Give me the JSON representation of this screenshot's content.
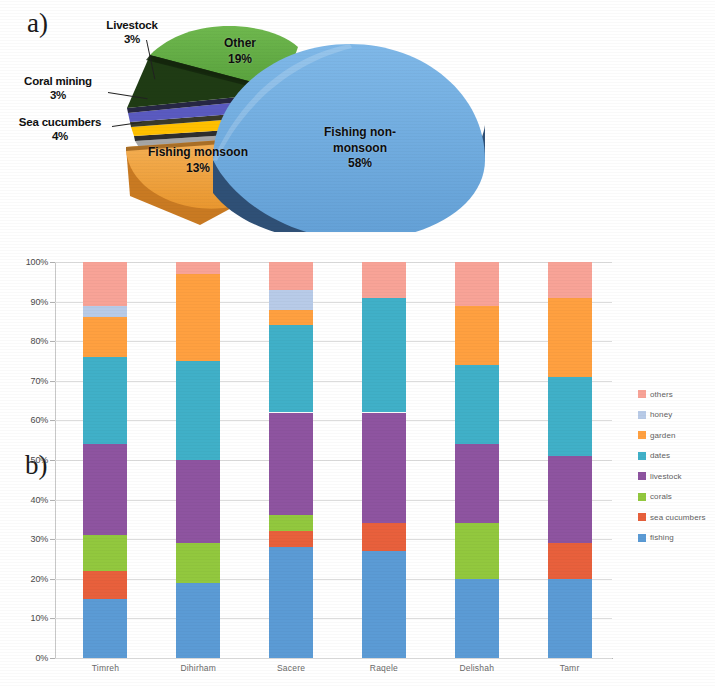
{
  "figure": {
    "panel_a_letter": "a)",
    "panel_b_letter": "b)"
  },
  "chart_data": [
    {
      "type": "pie",
      "title": "",
      "panel": "a)",
      "labels": [
        "Fishing non-monsoon",
        "Other",
        "Fishing monsoon",
        "Sea cucumbers",
        "Coral mining",
        "Livestock"
      ],
      "values": [
        58,
        19,
        13,
        4,
        3,
        3
      ],
      "value_labels": [
        "58%",
        "19%",
        "13%",
        "4%",
        "3%",
        "3%"
      ],
      "colors": [
        "#6aa9e0",
        "#61a845",
        "#f0a340",
        "#a6a6a6",
        "#ffc000",
        "#5a5ac0"
      ],
      "exploded": [
        "Fishing non-monsoon"
      ],
      "three_d": true,
      "legend": "none",
      "slices": [
        {
          "label": "Fishing non-monsoon",
          "label_text": "Fishing non-\nmonsoon",
          "value": 58,
          "value_label": "58%",
          "color": "#6aa9e0",
          "label_position": "inside"
        },
        {
          "label": "Other",
          "label_text": "Other",
          "value": 19,
          "value_label": "19%",
          "color": "#61a845",
          "label_position": "inside"
        },
        {
          "label": "Fishing monsoon",
          "label_text": "Fishing monsoon",
          "value": 13,
          "value_label": "13%",
          "color": "#f0a340",
          "label_position": "inside"
        },
        {
          "label": "Sea cucumbers",
          "label_text": "Sea cucumbers",
          "value": 4,
          "value_label": "4%",
          "color": "#a6a6a6",
          "label_position": "callout-left"
        },
        {
          "label": "Coral mining",
          "label_text": "Coral mining",
          "value": 3,
          "value_label": "3%",
          "color": "#ffc000",
          "label_position": "callout-left"
        },
        {
          "label": "Livestock",
          "label_text": "Livestock",
          "value": 3,
          "value_label": "3%",
          "color": "#5a5ac0",
          "label_position": "callout-top"
        }
      ]
    },
    {
      "type": "bar",
      "subtype": "stacked-100-percent",
      "panel": "b)",
      "title": "",
      "xlabel": "",
      "ylabel": "",
      "ylim": [
        0,
        100
      ],
      "ytick_labels": [
        "0%",
        "10%",
        "20%",
        "30%",
        "40%",
        "50%",
        "60%",
        "70%",
        "80%",
        "90%",
        "100%"
      ],
      "ytick_values": [
        0,
        10,
        20,
        30,
        40,
        50,
        60,
        70,
        80,
        90,
        100
      ],
      "grid": true,
      "legend_position": "right",
      "categories": [
        "Timreh",
        "Dihirham",
        "Sacere",
        "Raqele",
        "Delishah",
        "Tamr"
      ],
      "series": [
        {
          "name": "fishing",
          "color": "#5b9bd5",
          "values": [
            15,
            19,
            28,
            27,
            20,
            20
          ]
        },
        {
          "name": "sea cucumbers",
          "color": "#e8603c",
          "values": [
            7,
            0,
            4,
            7,
            0,
            9
          ]
        },
        {
          "name": "corals",
          "color": "#92c83e",
          "values": [
            9,
            10,
            4,
            0,
            14,
            0
          ]
        },
        {
          "name": "livestock",
          "color": "#8e54a0",
          "values": [
            23,
            21,
            26,
            28,
            20,
            22
          ]
        },
        {
          "name": "dates",
          "color": "#40b0c8",
          "values": [
            22,
            25,
            22,
            29,
            20,
            20
          ]
        },
        {
          "name": "garden",
          "color": "#ffa040",
          "values": [
            10,
            22,
            4,
            0,
            15,
            20
          ]
        },
        {
          "name": "honey",
          "color": "#b8cbe8",
          "values": [
            3,
            0,
            5,
            0,
            0,
            0
          ]
        },
        {
          "name": "others",
          "color": "#f8a397",
          "values": [
            11,
            3,
            7,
            9,
            11,
            9
          ]
        }
      ],
      "legend_entries": [
        {
          "label": "others",
          "color": "#f8a397"
        },
        {
          "label": "honey",
          "color": "#b8cbe8"
        },
        {
          "label": "garden",
          "color": "#ffa040"
        },
        {
          "label": "dates",
          "color": "#40b0c8"
        },
        {
          "label": "livestock",
          "color": "#8e54a0"
        },
        {
          "label": "corals",
          "color": "#92c83e"
        },
        {
          "label": "sea cucumbers",
          "color": "#e8603c"
        },
        {
          "label": "fishing",
          "color": "#5b9bd5"
        }
      ]
    }
  ]
}
